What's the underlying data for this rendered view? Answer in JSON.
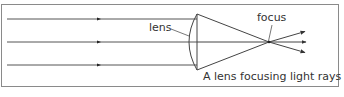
{
  "diagram": {
    "caption": "A lens focusing light rays",
    "labels": {
      "lens": "lens",
      "focus": "focus"
    },
    "colors": {
      "line": "#444444",
      "frame": "#8a8a8a",
      "text": "#333333",
      "background": "#ffffff"
    },
    "rays": [
      {
        "name": "top-ray",
        "y": 19
      },
      {
        "name": "middle-ray",
        "y": 42
      },
      {
        "name": "bottom-ray",
        "y": 65
      }
    ]
  }
}
